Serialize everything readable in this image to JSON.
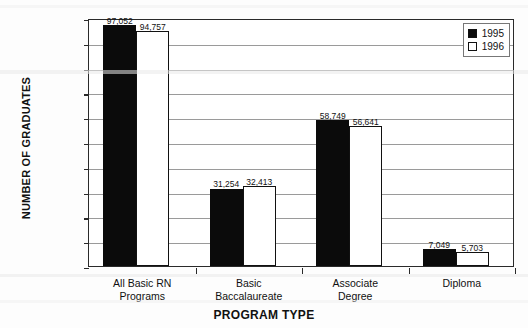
{
  "chart_data": {
    "type": "bar",
    "title": "",
    "xlabel": "PROGRAM TYPE",
    "ylabel": "NUMBER OF GRADUATES",
    "ylim": [
      0,
      100000
    ],
    "ytick_step": 10000,
    "grid": true,
    "legend_position": "top-right",
    "categories": [
      "All Basic RN\nPrograms",
      "Basic\nBaccalaureate",
      "Associate\nDegree",
      "Diploma"
    ],
    "category_lines": [
      [
        "All Basic RN",
        "Programs"
      ],
      [
        "Basic",
        "Baccalaureate"
      ],
      [
        "Associate",
        "Degree"
      ],
      [
        "Diploma",
        ""
      ]
    ],
    "series": [
      {
        "name": "1995",
        "color": "#0b0b0b",
        "values": [
          97052,
          31254,
          58749,
          7049
        ],
        "labels": [
          "97,052",
          "31,254",
          "58,749",
          "7,049"
        ]
      },
      {
        "name": "1996",
        "color": "#ffffff",
        "values": [
          94757,
          32413,
          56641,
          5703
        ],
        "labels": [
          "94,757",
          "32,413",
          "56,641",
          "5,703"
        ]
      }
    ],
    "ytick_labels": [
      "0",
      "10,000",
      "20,000",
      "30,000",
      "40,000",
      "50,000",
      "60,000",
      "70,000",
      "80,000",
      "90,000",
      "100,000"
    ],
    "ytick_values": [
      0,
      10000,
      20000,
      30000,
      40000,
      50000,
      60000,
      70000,
      80000,
      90000,
      100000
    ]
  },
  "legend": {
    "items": [
      {
        "label": "1995",
        "swatch": "filled-square"
      },
      {
        "label": "1996",
        "swatch": "hollow-square"
      }
    ]
  },
  "colors": {
    "series_1995": "#0b0b0b",
    "series_1996": "#ffffff",
    "axis": "#2a2a2a",
    "gridline": "#9a9a9a",
    "text": "#111111",
    "background": "#ffffff"
  }
}
